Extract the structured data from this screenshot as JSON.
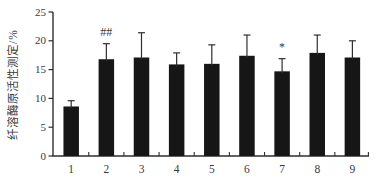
{
  "chart_data": {
    "type": "bar",
    "title": "",
    "xlabel": "",
    "ylabel": "纤溶酶原活性测定/%",
    "categories": [
      "1",
      "2",
      "3",
      "4",
      "5",
      "6",
      "7",
      "8",
      "9"
    ],
    "values": [
      8.6,
      16.8,
      17.1,
      15.9,
      16.0,
      17.4,
      14.7,
      17.9,
      17.1
    ],
    "errors": [
      1.0,
      2.7,
      4.3,
      2.0,
      3.3,
      3.6,
      2.2,
      3.1,
      2.9
    ],
    "annotations": [
      {
        "category": "2",
        "text": "##"
      },
      {
        "category": "7",
        "text": "*"
      }
    ],
    "yticks": [
      0,
      5,
      10,
      15,
      20,
      25
    ],
    "ylim": [
      0,
      25
    ],
    "grid": false,
    "legend": "none",
    "bar_color": "#161616",
    "axis_color": "#2e2e2e",
    "text_color": "#3a3a3a",
    "background": "#ffffff"
  }
}
